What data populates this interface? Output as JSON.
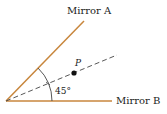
{
  "diagram": {
    "mirror_a_label": "Mirror A",
    "mirror_b_label": "Mirror B",
    "point_label": "P",
    "angle_label": "45°",
    "colors": {
      "mirror": "#c8863c",
      "line": "#333333",
      "point": "#111111"
    }
  }
}
